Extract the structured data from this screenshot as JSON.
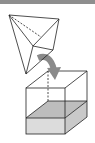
{
  "diagram": {
    "elements": [
      "tetrahedron",
      "curved-arrow",
      "cube",
      "filled-base-layer"
    ],
    "colors": {
      "header_bar": "#8e8e8e",
      "line": "#222222",
      "arrow": "#8a8a8a",
      "fill_top": "#bdbdbd",
      "fill_front": "#d9d9d9",
      "fill_side": "#c8c8c8"
    }
  }
}
